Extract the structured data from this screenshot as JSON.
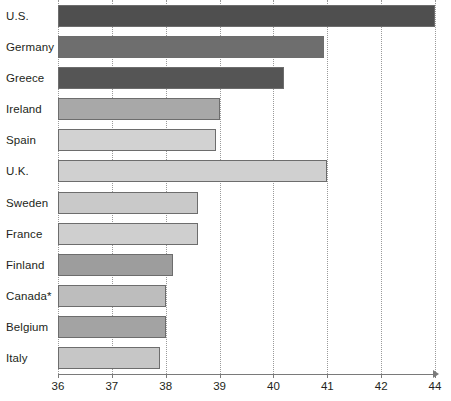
{
  "chart_data": {
    "type": "bar",
    "orientation": "horizontal",
    "title": "",
    "subtitle": "",
    "xlabel": "",
    "ylabel": "",
    "xlim": [
      36,
      44
    ],
    "grid": true,
    "legend": null,
    "axis_note": "x-axis tick labels skip 43; final labeled tick is 44",
    "xticks": [
      36,
      37,
      38,
      39,
      40,
      41,
      42,
      44
    ],
    "xticklabels": [
      "36",
      "37",
      "38",
      "39",
      "40",
      "41",
      "42",
      "44"
    ],
    "categories": [
      "U.S.",
      "Germany",
      "Greece",
      "Ireland",
      "Spain",
      "U.K.",
      "Sweden",
      "France",
      "Finland",
      "Canada*",
      "Belgium",
      "Italy"
    ],
    "values": [
      44.0,
      40.93,
      40.2,
      39.0,
      38.93,
      41.0,
      38.6,
      38.6,
      38.13,
      38.0,
      38.0,
      37.9
    ],
    "bar_colors": [
      "#4f4f4f",
      "#6e6e6e",
      "#555555",
      "#a8a8a8",
      "#d2d2d2",
      "#d0d0d0",
      "#c9c9c9",
      "#cfcfcf",
      "#9d9d9d",
      "#bdbdbd",
      "#a3a3a3",
      "#c6c6c6"
    ],
    "bar_edge_color": "#6d6d6d",
    "gridline_color": "#9a9a9a",
    "axis_color": "#7a7a7a",
    "text_color": "#231f20",
    "background": "#ffffff"
  }
}
